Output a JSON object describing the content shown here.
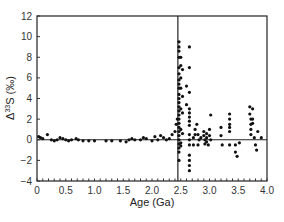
{
  "chart_data": {
    "type": "scatter",
    "title": "",
    "xlabel": "Age (Ga)",
    "ylabel": "Δ33S (‰)",
    "ylabel_parts": {
      "delta": "Δ",
      "sup": "33",
      "rest": "S (‰)"
    },
    "xlim": [
      0,
      4.0
    ],
    "ylim": [
      -4,
      12
    ],
    "xticks": [
      0,
      0.5,
      1.0,
      1.5,
      2.0,
      2.5,
      3.0,
      3.5,
      4.0
    ],
    "xtick_labels": [
      "0",
      "0.5",
      "1.0",
      "1.5",
      "2.0",
      "2.5",
      "3.0",
      "3.5",
      "4.0"
    ],
    "yticks": [
      -4,
      -2,
      0,
      2,
      4,
      6,
      8,
      10,
      12
    ],
    "ytick_labels": [
      "−4",
      "−2",
      "0",
      "2",
      "4",
      "6",
      "8",
      "10",
      "12"
    ],
    "grid": false,
    "legend": null,
    "reference_lines": [
      {
        "orientation": "horizontal",
        "value": 0
      },
      {
        "orientation": "vertical",
        "value": 2.45
      }
    ],
    "marker_color": "#111111",
    "series": [
      {
        "name": "Δ33S measurements",
        "points": [
          [
            0.03,
            0.3
          ],
          [
            0.06,
            0.2
          ],
          [
            0.1,
            0.1
          ],
          [
            0.18,
            0.5
          ],
          [
            0.25,
            0.0
          ],
          [
            0.3,
            -0.1
          ],
          [
            0.35,
            0.0
          ],
          [
            0.4,
            0.2
          ],
          [
            0.45,
            0.1
          ],
          [
            0.5,
            0.0
          ],
          [
            0.55,
            -0.1
          ],
          [
            0.6,
            0.0
          ],
          [
            0.68,
            0.1
          ],
          [
            0.72,
            0.0
          ],
          [
            0.8,
            -0.1
          ],
          [
            0.9,
            -0.1
          ],
          [
            1.0,
            -0.1
          ],
          [
            1.2,
            -0.1
          ],
          [
            1.3,
            -0.1
          ],
          [
            1.45,
            -0.1
          ],
          [
            1.55,
            -0.2
          ],
          [
            1.6,
            0.0
          ],
          [
            1.65,
            0.1
          ],
          [
            1.7,
            0.0
          ],
          [
            1.8,
            0.0
          ],
          [
            1.85,
            0.2
          ],
          [
            1.9,
            0.1
          ],
          [
            2.0,
            -0.1
          ],
          [
            2.05,
            0.3
          ],
          [
            2.1,
            0.0
          ],
          [
            2.15,
            0.4
          ],
          [
            2.2,
            0.2
          ],
          [
            2.25,
            0.0
          ],
          [
            2.3,
            0.1
          ],
          [
            2.35,
            0.5
          ],
          [
            2.4,
            0.8
          ],
          [
            2.42,
            1.5
          ],
          [
            2.44,
            2.0
          ],
          [
            2.47,
            9.5
          ],
          [
            2.47,
            9.0
          ],
          [
            2.47,
            8.6
          ],
          [
            2.47,
            8.0
          ],
          [
            2.47,
            7.0
          ],
          [
            2.47,
            6.4
          ],
          [
            2.47,
            5.8
          ],
          [
            2.47,
            5.4
          ],
          [
            2.47,
            5.0
          ],
          [
            2.47,
            4.4
          ],
          [
            2.47,
            4.0
          ],
          [
            2.47,
            3.6
          ],
          [
            2.47,
            3.2
          ],
          [
            2.47,
            2.8
          ],
          [
            2.47,
            2.4
          ],
          [
            2.47,
            2.0
          ],
          [
            2.47,
            1.6
          ],
          [
            2.47,
            1.2
          ],
          [
            2.47,
            0.8
          ],
          [
            2.47,
            0.4
          ],
          [
            2.47,
            0.0
          ],
          [
            2.47,
            -0.4
          ],
          [
            2.47,
            -0.8
          ],
          [
            2.47,
            -1.2
          ],
          [
            2.47,
            -2.0
          ],
          [
            2.5,
            8.0
          ],
          [
            2.5,
            7.2
          ],
          [
            2.5,
            6.0
          ],
          [
            2.5,
            5.0
          ],
          [
            2.5,
            3.0
          ],
          [
            2.5,
            1.0
          ],
          [
            2.5,
            -0.3
          ],
          [
            2.5,
            -0.6
          ],
          [
            2.53,
            6.8
          ],
          [
            2.53,
            4.2
          ],
          [
            2.53,
            2.6
          ],
          [
            2.53,
            0.6
          ],
          [
            2.6,
            5.2
          ],
          [
            2.6,
            3.4
          ],
          [
            2.65,
            9.0
          ],
          [
            2.65,
            7.0
          ],
          [
            2.65,
            4.6
          ],
          [
            2.65,
            3.0
          ],
          [
            2.65,
            2.6
          ],
          [
            2.65,
            2.2
          ],
          [
            2.65,
            1.8
          ],
          [
            2.65,
            1.4
          ],
          [
            2.65,
            0.5
          ],
          [
            2.65,
            0.0
          ],
          [
            2.65,
            -0.5
          ],
          [
            2.65,
            -1.5
          ],
          [
            2.65,
            -2.0
          ],
          [
            2.65,
            -2.5
          ],
          [
            2.65,
            -3.0
          ],
          [
            2.72,
            0.2
          ],
          [
            2.72,
            -0.5
          ],
          [
            2.75,
            0.5
          ],
          [
            2.75,
            1.0
          ],
          [
            2.78,
            1.5
          ],
          [
            2.8,
            0.5
          ],
          [
            2.8,
            -0.5
          ],
          [
            2.82,
            0.0
          ],
          [
            2.85,
            0.2
          ],
          [
            2.9,
            0.8
          ],
          [
            2.9,
            0.4
          ],
          [
            2.92,
            0.0
          ],
          [
            2.92,
            -0.4
          ],
          [
            2.95,
            0.6
          ],
          [
            2.95,
            0.2
          ],
          [
            2.95,
            -0.2
          ],
          [
            2.98,
            -0.5
          ],
          [
            3.0,
            0.4
          ],
          [
            3.0,
            1.0
          ],
          [
            3.02,
            2.4
          ],
          [
            3.02,
            0.0
          ],
          [
            3.2,
            1.2
          ],
          [
            3.2,
            0.4
          ],
          [
            3.22,
            -0.5
          ],
          [
            3.35,
            2.5
          ],
          [
            3.35,
            2.0
          ],
          [
            3.35,
            1.5
          ],
          [
            3.35,
            1.2
          ],
          [
            3.35,
            0.8
          ],
          [
            3.35,
            -0.5
          ],
          [
            3.45,
            -1.2
          ],
          [
            3.45,
            -0.5
          ],
          [
            3.48,
            -1.6
          ],
          [
            3.52,
            -0.3
          ],
          [
            3.7,
            3.2
          ],
          [
            3.7,
            2.5
          ],
          [
            3.72,
            2.0
          ],
          [
            3.72,
            1.5
          ],
          [
            3.72,
            1.0
          ],
          [
            3.72,
            0.5
          ],
          [
            3.75,
            2.0
          ],
          [
            3.75,
            1.6
          ],
          [
            3.75,
            3.0
          ],
          [
            3.78,
            0.2
          ],
          [
            3.8,
            -0.5
          ],
          [
            3.82,
            -1.0
          ],
          [
            3.84,
            0.8
          ],
          [
            3.9,
            0.2
          ]
        ]
      }
    ]
  }
}
